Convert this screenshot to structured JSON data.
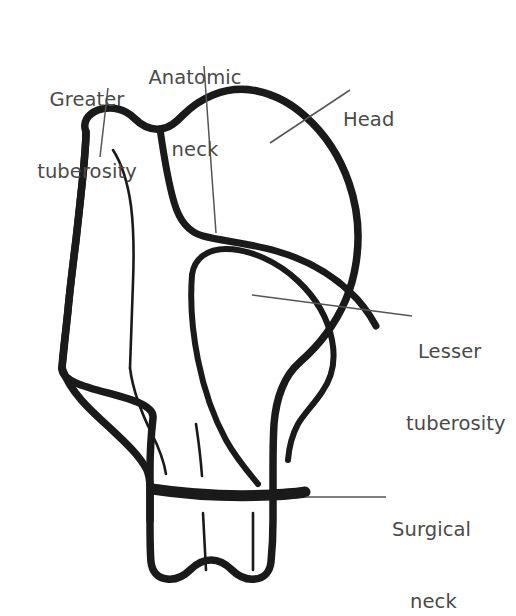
{
  "figure": {
    "background_color": "#ffffff",
    "outline_color": "#1a1a1a",
    "leader_line_color": "#555555",
    "label_text_color": "#4a4a4a",
    "canvas": {
      "width": 516,
      "height": 616
    }
  },
  "labels": [
    {
      "id": "greater-tuberosity",
      "text": "Greater\ntuberosity",
      "line1": "Greater",
      "line2": "tuberosity",
      "x": 22,
      "y": 40,
      "align": "center",
      "leader": {
        "x1": 108,
        "y1": 88,
        "x2": 100,
        "y2": 157
      }
    },
    {
      "id": "anatomic-neck",
      "text": "Anatomic\nneck",
      "line1": "Anatomic",
      "line2": "neck",
      "x": 140,
      "y": 18,
      "align": "center",
      "leader": {
        "x1": 204,
        "y1": 66,
        "x2": 216,
        "y2": 233
      }
    },
    {
      "id": "head",
      "text": "Head",
      "line1": "Head",
      "line2": "",
      "x": 343,
      "y": 60,
      "align": "left",
      "leader": {
        "x1": 350,
        "y1": 90,
        "x2": 270,
        "y2": 143
      }
    },
    {
      "id": "lesser-tuberosity",
      "text": "Lesser\ntuberosity",
      "line1": "Lesser",
      "line2": "tuberosity",
      "x": 418,
      "y": 292,
      "align": "left",
      "leader": {
        "x1": 412,
        "y1": 316,
        "x2": 252,
        "y2": 295
      }
    },
    {
      "id": "surgical-neck",
      "text": "Surgical\nneck",
      "line1": "Surgical",
      "line2": "neck",
      "x": 392,
      "y": 470,
      "align": "left",
      "leader": {
        "x1": 386,
        "y1": 497,
        "x2": 306,
        "y2": 497
      }
    }
  ],
  "structures": [
    {
      "id": "humeral-head",
      "name": "Head of humerus"
    },
    {
      "id": "greater-tuberosity-outline",
      "name": "Greater tuberosity"
    },
    {
      "id": "lesser-tuberosity-outline",
      "name": "Lesser tuberosity"
    },
    {
      "id": "anatomic-neck-line",
      "name": "Anatomic neck"
    },
    {
      "id": "surgical-neck-band",
      "name": "Surgical neck"
    },
    {
      "id": "intertubercular-groove",
      "name": "Intertubercular groove"
    },
    {
      "id": "humeral-shaft",
      "name": "Shaft of humerus"
    }
  ]
}
